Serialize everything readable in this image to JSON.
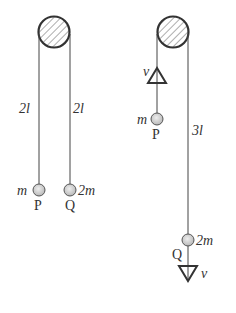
{
  "diagram": {
    "left": {
      "left_length_label": "2l",
      "right_length_label": "2l",
      "ball_p": {
        "mass_label": "m",
        "name_label": "P"
      },
      "ball_q": {
        "mass_label": "2m",
        "name_label": "Q"
      }
    },
    "right": {
      "velocity_up_label": "v",
      "ball_p": {
        "mass_label": "m",
        "name_label": "P"
      },
      "string_length_label": "3l",
      "ball_q": {
        "mass_label": "2m",
        "name_label": "Q"
      },
      "velocity_down_label": "v"
    },
    "colors": {
      "line": "#333333",
      "ball_fill": "#c8c8c8",
      "hatch": "#666666"
    }
  }
}
